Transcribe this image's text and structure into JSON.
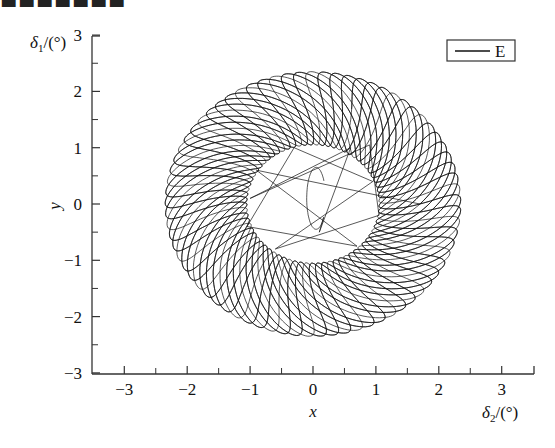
{
  "caption_fragment": "■■■■■■■",
  "chart_data": {
    "type": "line",
    "title": "",
    "xlabel": "x",
    "ylabel": "y",
    "x_unit_label": "δ2/(°)",
    "y_unit_label": "δ1/(°)",
    "xlim": [
      -3.5,
      3.5
    ],
    "ylim": [
      -3,
      3
    ],
    "xticks": [
      -3,
      -2,
      -1,
      0,
      1,
      2,
      3
    ],
    "yticks": [
      3,
      2,
      1,
      0,
      -1,
      -2,
      -3
    ],
    "xtick_labels": [
      "−3",
      "−2",
      "−1",
      "0",
      "1",
      "2",
      "3"
    ],
    "ytick_labels": [
      "3",
      "2",
      "1",
      "0",
      "−1",
      "−2",
      "−3"
    ],
    "grid": false,
    "legend": {
      "position": "upper right",
      "entries": [
        "E"
      ]
    },
    "series": [
      {
        "name": "E",
        "color": "#111111",
        "description": "Quasi-periodic rosette trajectory filling an annulus centered at origin",
        "annulus": {
          "outer_radius": 2.35,
          "inner_radius": 1.05
        },
        "initial_spiral": "small loop near origin around (0, 0.1) with amplitude ~0.3 in x, ~0.6 in y"
      }
    ]
  },
  "axes": {
    "x_title": "x",
    "y_title": "y",
    "x_unit": "δ",
    "x_unit_sub": "2",
    "x_unit_tail": "/(°)",
    "y_unit": "δ",
    "y_unit_sub": "1",
    "y_unit_tail": "/(°)"
  },
  "legend": {
    "label": "E"
  }
}
